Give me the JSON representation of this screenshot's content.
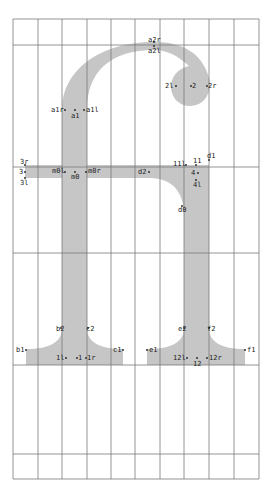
{
  "diagram": {
    "colors": {
      "background": "#ffffff",
      "glyph_fill": "#c6c6c6",
      "grid_line": "#7a7a7a",
      "label": "#222222"
    },
    "grid": {
      "x_lines": [
        13,
        38,
        62,
        87,
        111,
        135,
        160,
        184,
        209,
        234,
        259
      ],
      "y_lines": [
        19,
        45,
        167,
        253,
        365,
        454,
        479
      ]
    },
    "points": [
      {
        "label": "a2r",
        "x": 154,
        "y": 42,
        "lx": 148,
        "ly": 42
      },
      {
        "label": "a2l",
        "x": 154,
        "y": 46,
        "lx": 148,
        "ly": 53
      },
      {
        "label": "2l",
        "x": 176,
        "y": 86,
        "lx": 165,
        "ly": 88
      },
      {
        "label": "2",
        "x": 191,
        "y": 86,
        "lx": 192,
        "ly": 88
      },
      {
        "label": "2r",
        "x": 207,
        "y": 86,
        "lx": 208,
        "ly": 88
      },
      {
        "label": "a1r",
        "x": 65,
        "y": 110,
        "lx": 51,
        "ly": 112
      },
      {
        "label": "a1",
        "x": 75,
        "y": 110,
        "lx": 71,
        "ly": 118
      },
      {
        "label": "a1l",
        "x": 84,
        "y": 110,
        "lx": 86,
        "ly": 112
      },
      {
        "label": "3r",
        "x": 25,
        "y": 165,
        "lx": 20,
        "ly": 164
      },
      {
        "label": "3",
        "x": 25,
        "y": 172,
        "lx": 19,
        "ly": 174
      },
      {
        "label": "3l",
        "x": 25,
        "y": 178,
        "lx": 20,
        "ly": 185
      },
      {
        "label": "m0l",
        "x": 65,
        "y": 172,
        "lx": 52,
        "ly": 173
      },
      {
        "label": "m0",
        "x": 75,
        "y": 172,
        "lx": 71,
        "ly": 179
      },
      {
        "label": "m0r",
        "x": 86,
        "y": 172,
        "lx": 88,
        "ly": 173
      },
      {
        "label": "d2",
        "x": 149,
        "y": 172,
        "lx": 138,
        "ly": 174
      },
      {
        "label": "d1",
        "x": 209,
        "y": 160,
        "lx": 207,
        "ly": 158
      },
      {
        "label": "11l",
        "x": 186,
        "y": 165,
        "lx": 173,
        "ly": 166
      },
      {
        "label": "11",
        "x": 196,
        "y": 165,
        "lx": 193,
        "ly": 163
      },
      {
        "label": "4",
        "x": 198,
        "y": 173,
        "lx": 191,
        "ly": 175
      },
      {
        "label": "4l",
        "x": 196,
        "y": 180,
        "lx": 193,
        "ly": 187
      },
      {
        "label": "d0",
        "x": 182,
        "y": 206,
        "lx": 178,
        "ly": 212
      },
      {
        "label": "b2",
        "x": 61,
        "y": 328,
        "lx": 56,
        "ly": 331
      },
      {
        "label": "c2",
        "x": 88,
        "y": 328,
        "lx": 86,
        "ly": 331
      },
      {
        "label": "b1",
        "x": 26,
        "y": 350,
        "lx": 16,
        "ly": 352
      },
      {
        "label": "c1",
        "x": 123,
        "y": 350,
        "lx": 113,
        "ly": 352
      },
      {
        "label": "1l",
        "x": 66,
        "y": 358,
        "lx": 56,
        "ly": 360
      },
      {
        "label": "1",
        "x": 77,
        "y": 358,
        "lx": 78,
        "ly": 360
      },
      {
        "label": "1r",
        "x": 86,
        "y": 358,
        "lx": 87,
        "ly": 360
      },
      {
        "label": "e2",
        "x": 184,
        "y": 328,
        "lx": 178,
        "ly": 331
      },
      {
        "label": "f2",
        "x": 209,
        "y": 328,
        "lx": 207,
        "ly": 331
      },
      {
        "label": "e1",
        "x": 147,
        "y": 350,
        "lx": 149,
        "ly": 352
      },
      {
        "label": "f1",
        "x": 245,
        "y": 350,
        "lx": 247,
        "ly": 352
      },
      {
        "label": "12l",
        "x": 187,
        "y": 358,
        "lx": 173,
        "ly": 360
      },
      {
        "label": "12",
        "x": 197,
        "y": 358,
        "lx": 193,
        "ly": 366
      },
      {
        "label": "12r",
        "x": 207,
        "y": 358,
        "lx": 209,
        "ly": 360
      }
    ]
  }
}
